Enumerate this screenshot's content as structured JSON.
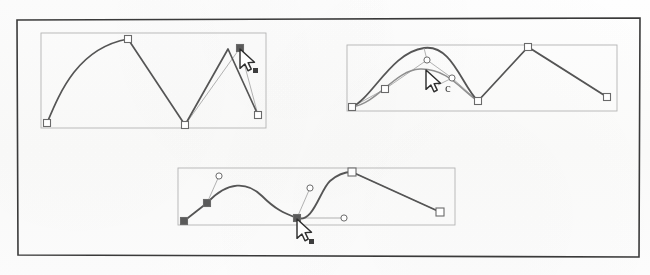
{
  "figure": {
    "background_color": "#fdfdfc",
    "frame": {
      "name": "outer-frame",
      "color": "#3a3a3a",
      "x": 17,
      "y": 18,
      "width": 623,
      "height": 239
    }
  },
  "colors": {
    "path_stroke": "#555555",
    "path_stroke_light": "#8f8f8f",
    "handle_line": "#a8a8a8",
    "box_stroke": "#b3b3b3",
    "node_fill_hollow": "#ffffff",
    "node_fill_solid": "#5a5a5a",
    "node_stroke": "#6b6b6b",
    "cursor_fill": "#ffffff",
    "cursor_stroke": "#2e2e2e",
    "badge_fill": "#3c3c3c"
  },
  "panels": [
    {
      "id": "panel-1",
      "label": "Panel 1 - polyline with corner nodes and selected node",
      "box": {
        "x": 41,
        "y": 33,
        "width": 225,
        "height": 95
      },
      "path_d": "M 47 123 C 60 92 78 48 128 39 L 185 125 L 228 49 L 258 115",
      "path_stroke_width": 1.7,
      "guide_lines": [
        {
          "x1": 185,
          "y1": 125,
          "x2": 240,
          "y2": 48
        },
        {
          "x1": 240,
          "y1": 48,
          "x2": 258,
          "y2": 115
        }
      ],
      "nodes": [
        {
          "x": 47,
          "y": 123,
          "shape": "square-hollow",
          "size": 7,
          "name": "node-start"
        },
        {
          "x": 128,
          "y": 39,
          "shape": "square-hollow",
          "size": 7,
          "name": "node-peak"
        },
        {
          "x": 185,
          "y": 125,
          "shape": "square-hollow",
          "size": 7,
          "name": "node-valley"
        },
        {
          "x": 240,
          "y": 48,
          "shape": "square-solid",
          "size": 7,
          "name": "node-selected"
        },
        {
          "x": 258,
          "y": 115,
          "shape": "square-hollow",
          "size": 7,
          "name": "node-end"
        }
      ],
      "cursor": {
        "x": 240,
        "y": 49,
        "badge_dx": 13,
        "badge_dy": 19,
        "name": "pointer-cursor"
      }
    },
    {
      "id": "panel-2",
      "label": "Panel 2 - smoothed curve with bezier control handles",
      "box": {
        "x": 347,
        "y": 45,
        "width": 270,
        "height": 66
      },
      "path_d": "M 352 107 C 372 98 392 52 424 48 C 452 44 462 86 478 101 L 528 47 L 607 97",
      "path_stroke_width": 1.8,
      "path_under_d": "M 352 107 C 378 103 395 70 420 69 C 448 68 463 92 478 101",
      "path_under_stroke_width": 1.5,
      "guide_lines": [
        {
          "x1": 352,
          "y1": 107,
          "x2": 385,
          "y2": 89
        },
        {
          "x1": 385,
          "y1": 89,
          "x2": 427,
          "y2": 60
        },
        {
          "x1": 427,
          "y1": 60,
          "x2": 452,
          "y2": 78
        },
        {
          "x1": 452,
          "y1": 78,
          "x2": 478,
          "y2": 101
        },
        {
          "x1": 478,
          "y1": 101,
          "x2": 528,
          "y2": 47
        },
        {
          "x1": 528,
          "y1": 47,
          "x2": 607,
          "y2": 97
        }
      ],
      "handles": [
        {
          "anchor_x": 424,
          "anchor_y": 48,
          "cx": 427,
          "cy": 60,
          "name": "handle-left"
        },
        {
          "anchor_x": 438,
          "anchor_y": 85,
          "cx": 452,
          "cy": 78,
          "name": "handle-right"
        }
      ],
      "nodes": [
        {
          "x": 352,
          "y": 107,
          "shape": "square-hollow",
          "size": 7,
          "name": "node-start"
        },
        {
          "x": 385,
          "y": 89,
          "shape": "square-hollow",
          "size": 7,
          "name": "node-mid-left"
        },
        {
          "x": 478,
          "y": 101,
          "shape": "square-hollow",
          "size": 7,
          "name": "node-valley"
        },
        {
          "x": 528,
          "y": 47,
          "shape": "square-hollow",
          "size": 7,
          "name": "node-peak"
        },
        {
          "x": 607,
          "y": 97,
          "shape": "square-hollow",
          "size": 7,
          "name": "node-end"
        }
      ],
      "cursor": {
        "x": 426,
        "y": 70,
        "badge_dx": 0,
        "badge_dy": 0,
        "name": "pointer-cursor"
      },
      "drag_mark": {
        "x": 445,
        "y": 92,
        "glyph": "c",
        "name": "drag-arc-mark"
      }
    },
    {
      "id": "panel-3",
      "label": "Panel 3 - finished smooth curve with extended handles",
      "box": {
        "x": 178,
        "y": 168,
        "width": 277,
        "height": 57
      },
      "path_d": "M 184 221 L 207 203 C 228 180 248 182 262 196 C 276 210 284 213 297 218 C 313 224 320 190 330 181 C 338 174 344 172 352 172 L 440 212",
      "path_stroke_width": 1.8,
      "guide_lines": [
        {
          "x1": 207,
          "y1": 203,
          "x2": 219,
          "y2": 176
        },
        {
          "x1": 297,
          "y1": 218,
          "x2": 310,
          "y2": 188
        },
        {
          "x1": 297,
          "y1": 218,
          "x2": 344,
          "y2": 218
        },
        {
          "x1": 352,
          "y1": 172,
          "x2": 440,
          "y2": 212
        }
      ],
      "handles": [
        {
          "cx": 219,
          "cy": 176,
          "name": "handle-left-upper"
        },
        {
          "cx": 310,
          "cy": 188,
          "name": "handle-mid-upper"
        },
        {
          "cx": 344,
          "cy": 218,
          "name": "handle-mid-right"
        }
      ],
      "nodes": [
        {
          "x": 184,
          "y": 221,
          "shape": "square-solid",
          "size": 7,
          "name": "node-start"
        },
        {
          "x": 207,
          "y": 203,
          "shape": "square-solid",
          "size": 7,
          "name": "node-corner"
        },
        {
          "x": 297,
          "y": 218,
          "shape": "square-solid",
          "size": 7,
          "name": "node-selected"
        },
        {
          "x": 352,
          "y": 172,
          "shape": "square-hollow",
          "size": 8,
          "name": "node-peak"
        },
        {
          "x": 440,
          "y": 212,
          "shape": "square-hollow",
          "size": 8,
          "name": "node-end"
        }
      ],
      "cursor": {
        "x": 297,
        "y": 219,
        "badge_dx": 12,
        "badge_dy": 20,
        "name": "pointer-cursor"
      }
    }
  ]
}
